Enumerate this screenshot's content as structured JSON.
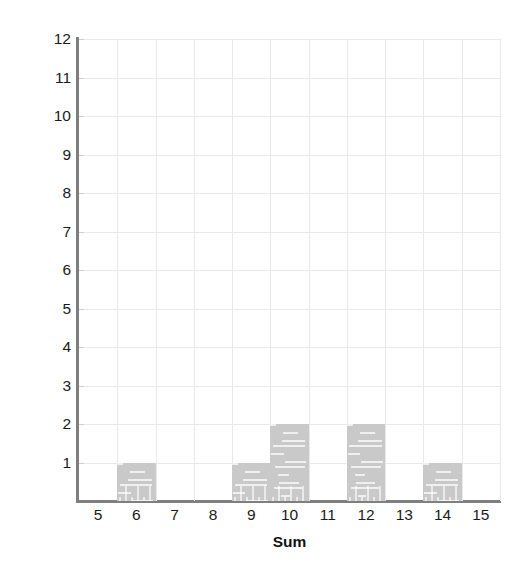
{
  "chart_data": {
    "type": "bar",
    "title": "",
    "xlabel": "Sum",
    "ylabel": "Number of times sum was rolled",
    "categories": [
      5,
      6,
      7,
      8,
      9,
      10,
      11,
      12,
      13,
      14,
      15
    ],
    "values": [
      0,
      1,
      0,
      0,
      1,
      2,
      0,
      2,
      0,
      1,
      0
    ],
    "xlim": [
      4.5,
      15.5
    ],
    "ylim": [
      0,
      12
    ],
    "xticks": [
      "5",
      "6",
      "7",
      "8",
      "9",
      "10",
      "11",
      "12",
      "13",
      "14",
      "15"
    ],
    "yticks": [
      "1",
      "2",
      "3",
      "4",
      "5",
      "6",
      "7",
      "8",
      "9",
      "10",
      "11",
      "12"
    ],
    "grid": true,
    "legend": "none",
    "bar_color": "#c9c9c9",
    "grid_color": "#e9e9e9",
    "axis_color": "#7f7f7f",
    "text_color": "#1a1a1a"
  }
}
